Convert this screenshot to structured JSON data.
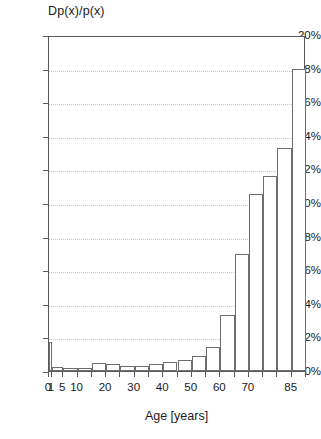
{
  "chart_data": {
    "type": "bar",
    "title": "",
    "ylabel": "Dp(x)/p(x)",
    "xlabel": "Age [years]",
    "ylim": [
      0,
      20
    ],
    "yunit": "%",
    "grid": true,
    "legend": null,
    "ytick_labels": [
      "0%",
      "2%",
      "4%",
      "6%",
      "8%",
      "10%",
      "12%",
      "14%",
      "16%",
      "18%",
      "20%"
    ],
    "ytick_values": [
      0,
      2,
      4,
      6,
      8,
      10,
      12,
      14,
      16,
      18,
      20
    ],
    "xtick_labels": [
      "0",
      "1",
      "5",
      "10",
      "20",
      "30",
      "40",
      "50",
      "60",
      "70",
      "85"
    ],
    "xtick_values": [
      0,
      1,
      5,
      10,
      20,
      30,
      40,
      50,
      60,
      70,
      85
    ],
    "xlim": [
      0,
      90
    ],
    "categories": [
      "0",
      "1-4",
      "5-9",
      "10-14",
      "15-19",
      "20-24",
      "25-29",
      "30-34",
      "35-39",
      "40-44",
      "45-49",
      "50-54",
      "55-59",
      "60-64",
      "65-69",
      "70-74",
      "75-79",
      "80-84",
      "85+"
    ],
    "bar_starts": [
      0,
      1,
      5,
      10,
      15,
      20,
      25,
      30,
      35,
      40,
      45,
      50,
      55,
      60,
      65,
      70,
      75,
      80,
      85
    ],
    "bar_widths": [
      1,
      4,
      5,
      5,
      5,
      5,
      5,
      5,
      5,
      5,
      5,
      5,
      5,
      5,
      5,
      5,
      5,
      5,
      5
    ],
    "values": [
      1.75,
      0.25,
      0.2,
      0.15,
      0.45,
      0.4,
      0.3,
      0.3,
      0.4,
      0.55,
      0.65,
      0.9,
      1.45,
      3.35,
      6.95,
      10.55,
      11.6,
      13.3,
      18.0
    ]
  }
}
